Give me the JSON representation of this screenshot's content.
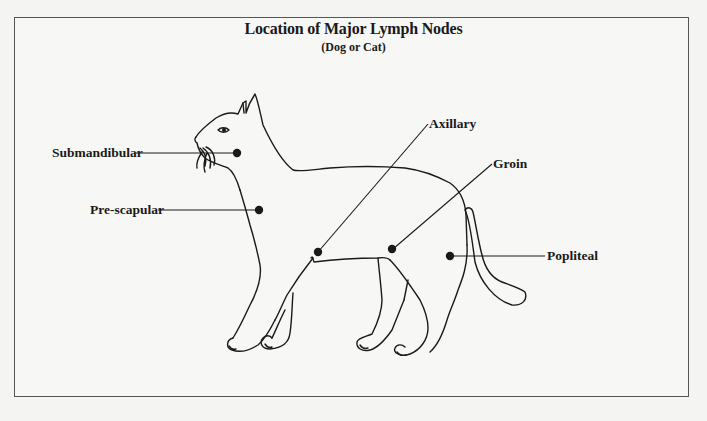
{
  "diagram": {
    "title": "Location of Major Lymph Nodes",
    "subtitle": "(Dog or Cat)",
    "labels": [
      {
        "id": "submandibular",
        "text": "Submandibular"
      },
      {
        "id": "pre-scapular",
        "text": "Pre-scapular"
      },
      {
        "id": "axillary",
        "text": "Axillary"
      },
      {
        "id": "groin",
        "text": "Groin"
      },
      {
        "id": "popliteal",
        "text": "Popliteal"
      }
    ],
    "colors": {
      "line": "#1a1a1a",
      "frame": "#555555",
      "background": "#f7f7f5"
    }
  }
}
